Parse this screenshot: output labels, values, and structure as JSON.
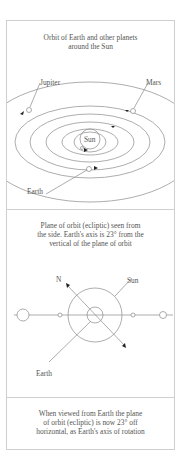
{
  "panels": [
    {
      "caption": "Orbit of Earth and other planets\naround the Sun",
      "labels": {
        "jupiter": "Jupiter",
        "mars": "Mars",
        "sun": "Sun",
        "earth": "Earth"
      }
    },
    {
      "caption": "Plane of orbit (ecliptic) seen from\nthe side. Earth's axis is 23° from the\nvertical of the plane of orbit",
      "labels": {
        "north": "N",
        "sun": "Sun",
        "earth": "Earth"
      }
    },
    {
      "caption": "When viewed from Earth the plane\nof orbit (ecliptic) is now 23° off\nhorizontal, as Earth's axis of rotation"
    }
  ],
  "colors": {
    "line": "#8a8a8a",
    "frame": "#cfcfcf",
    "text": "#555555"
  }
}
